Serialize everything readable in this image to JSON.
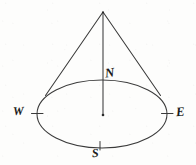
{
  "figure": {
    "kind": "hand-drawn-cone-compass-diagram",
    "width": 196,
    "height": 165,
    "background_color": "#fdfdfc",
    "ink_color": "#1d1d1d",
    "stroke_color": "#3a3a3a"
  },
  "labels": {
    "north": "N",
    "west": "W",
    "east": "E",
    "south": "S"
  },
  "geometry": {
    "apex": {
      "x": 103,
      "y": 12
    },
    "base_center": {
      "x": 102,
      "y": 114
    },
    "base_rx": 65,
    "base_ry": 34,
    "left_tangent": {
      "x": 46,
      "y": 95
    },
    "right_tangent": {
      "x": 160,
      "y": 95
    },
    "axis_bottom": {
      "x": 103,
      "y": 115
    },
    "tick_west": {
      "x": 37,
      "y": 114
    },
    "tick_east": {
      "x": 167,
      "y": 114
    },
    "tick_south": {
      "x": 100,
      "y": 145
    }
  }
}
